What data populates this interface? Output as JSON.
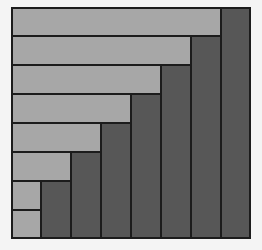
{
  "diagram": {
    "colors": {
      "light": "#a7a7a7",
      "dark": "#575757",
      "border": "#1c1c1c",
      "background": "#f4f4f4"
    },
    "grid": {
      "columns": 8,
      "rows": 8,
      "cell_width": 30,
      "cell_height": 29
    },
    "light_bars": [
      {
        "row": 1,
        "span_columns": 7
      },
      {
        "row": 2,
        "span_columns": 6
      },
      {
        "row": 3,
        "span_columns": 5
      },
      {
        "row": 4,
        "span_columns": 4
      },
      {
        "row": 5,
        "span_columns": 3
      },
      {
        "row": 6,
        "span_columns": 2
      },
      {
        "row": 7,
        "span_columns": 1
      },
      {
        "row": 8,
        "span_columns": 1
      }
    ],
    "dark_columns": [
      {
        "column": 8,
        "start_row": 1
      },
      {
        "column": 7,
        "start_row": 2
      },
      {
        "column": 6,
        "start_row": 3
      },
      {
        "column": 5,
        "start_row": 4
      },
      {
        "column": 4,
        "start_row": 5
      },
      {
        "column": 3,
        "start_row": 6
      },
      {
        "column": 2,
        "start_row": 7
      }
    ]
  }
}
